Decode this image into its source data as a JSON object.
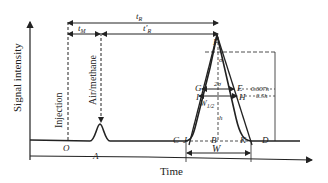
{
  "axes": {
    "y_label": "Signal intensity",
    "x_label": "Time"
  },
  "markers": {
    "injection": "Injection",
    "air_methane": "Air/methane"
  },
  "time_labels": {
    "tR": "t",
    "tR_sub": "R",
    "tM": "t",
    "tM_sub": "M",
    "tR_prime": "t′",
    "tR_prime_sub": "R"
  },
  "points": {
    "O": "O",
    "A": "A",
    "C": "C",
    "D": "D",
    "F": "F",
    "G": "G",
    "E": "E",
    "I": "I",
    "H": "H",
    "J": "J",
    "K": "K",
    "B": "B"
  },
  "annotations": {
    "two_sigma": "2σ",
    "sigma": "σ",
    "w_half": "W",
    "w_half_sub": "1/2",
    "w_base": "W",
    "h": "h",
    "h_0607": "0.607h",
    "h_05": "0.5h"
  },
  "colors": {
    "line": "#222222",
    "background": "#ffffff"
  }
}
